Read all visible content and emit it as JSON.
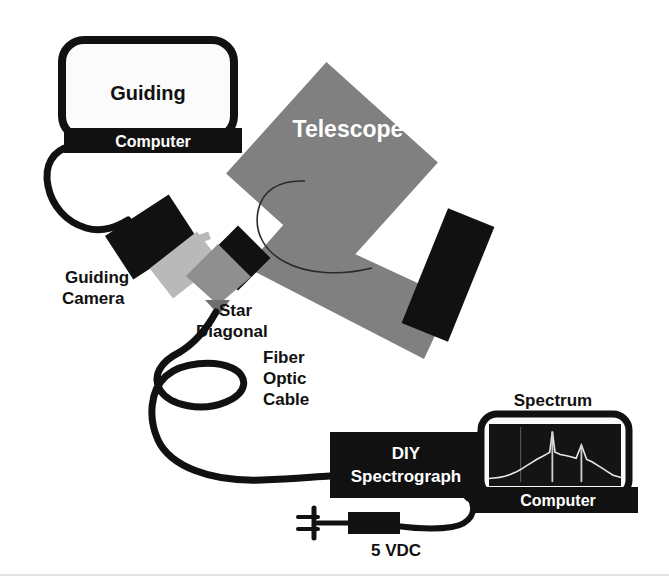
{
  "diagram": {
    "background_color": "#ffffff",
    "colors": {
      "black": "#111111",
      "telescope_gray": "#808080",
      "tube_light_gray": "#b9b9b9",
      "diagonal_gray": "#8f8f8f",
      "screen_white": "#fbfbfb",
      "screen_dark": "#141414",
      "trace_white": "#e8e8e8",
      "cable_black": "#111111"
    },
    "nodes": {
      "guiding_computer": {
        "screen_label": "Guiding",
        "base_label": "Computer"
      },
      "telescope": {
        "label": "Telescope"
      },
      "guiding_camera": {
        "label_line1": "Guiding",
        "label_line2": "Camera"
      },
      "star_diagonal": {
        "label_line1": "Star",
        "label_line2": "Diagonal"
      },
      "fiber_optic_cable": {
        "label_line1": "Fiber",
        "label_line2": "Optic",
        "label_line3": "Cable"
      },
      "spectrograph": {
        "label_line1": "DIY",
        "label_line2": "Spectrograph"
      },
      "power_supply": {
        "label": "5 VDC"
      },
      "spectrum_computer": {
        "title_label": "Spectrum",
        "base_label": "Computer"
      }
    },
    "connections": [
      {
        "name": "guiding-computer-to-camera",
        "from": "guiding_computer",
        "to": "guiding_camera"
      },
      {
        "name": "diagonal-to-spectrograph-fiber",
        "from": "star_diagonal",
        "to": "spectrograph"
      },
      {
        "name": "spectrograph-to-spectrum-computer",
        "from": "spectrograph",
        "to": "spectrum_computer"
      },
      {
        "name": "spectrograph-to-power",
        "from": "spectrograph",
        "to": "power_supply"
      }
    ]
  },
  "chart_data": {
    "type": "line",
    "title": "Spectrum",
    "xlabel": "",
    "ylabel": "",
    "grid": false,
    "legend": "none",
    "x": [
      0,
      4,
      8,
      12,
      16,
      20,
      24,
      28,
      32,
      36,
      40,
      44,
      46,
      48,
      50,
      52,
      54,
      58,
      62,
      66,
      70,
      74,
      78,
      82,
      86,
      90,
      94,
      100
    ],
    "values": [
      8,
      9,
      10,
      12,
      15,
      19,
      24,
      30,
      36,
      42,
      47,
      52,
      55,
      92,
      55,
      53,
      51,
      49,
      47,
      44,
      68,
      42,
      38,
      32,
      26,
      20,
      14,
      10
    ],
    "annotations": [
      {
        "name": "emission-line-main",
        "x": 48,
        "height": 92
      },
      {
        "name": "emission-line-secondary",
        "x": 70,
        "height": 68
      },
      {
        "name": "faint-vertical-marker",
        "x": 24,
        "height": 100
      }
    ],
    "ylim": [
      0,
      100
    ],
    "xlim": [
      0,
      100
    ]
  }
}
